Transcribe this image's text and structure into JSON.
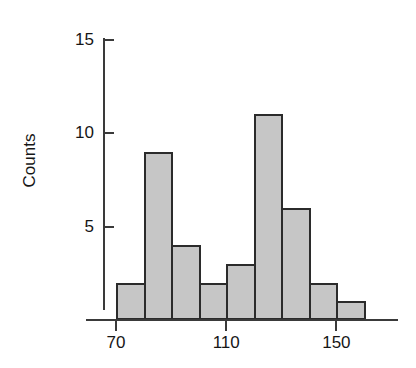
{
  "chart_data": {
    "type": "bar",
    "title": "",
    "subtitle": "",
    "xlabel": "",
    "ylabel": "Counts",
    "bin_width": 10,
    "bin_starts": [
      70,
      80,
      90,
      100,
      110,
      120,
      130,
      140,
      150
    ],
    "categories": [
      "70-80",
      "80-90",
      "90-100",
      "100-110",
      "110-120",
      "120-130",
      "130-140",
      "140-150",
      "150-160"
    ],
    "values": [
      2,
      9,
      4,
      2,
      3,
      11,
      6,
      2,
      1
    ],
    "xlim": [
      70,
      160
    ],
    "ylim": [
      0,
      16
    ],
    "x_ticks": [
      70,
      110,
      150
    ],
    "x_tick_labels": [
      "70",
      "110",
      "150"
    ],
    "y_ticks": [
      5,
      10,
      15
    ],
    "y_tick_labels": [
      "5",
      "10",
      "15"
    ],
    "grid": false,
    "legend": false,
    "legend_position": "none",
    "bar_fill_color": "#c6c6c6",
    "bar_edge_color": "#2b2b2b",
    "axis_color": "#3a3a3a",
    "background_color": "#ffffff"
  },
  "axes": {
    "y_title": "Counts",
    "y_ticks": [
      {
        "label": "15",
        "value": 15
      },
      {
        "label": "10",
        "value": 10
      },
      {
        "label": "5",
        "value": 5
      }
    ],
    "x_ticks": [
      {
        "label": "70",
        "value": 70
      },
      {
        "label": "110",
        "value": 110
      },
      {
        "label": "150",
        "value": 150
      }
    ]
  },
  "bars": [
    {
      "label": "70-80",
      "value": 2
    },
    {
      "label": "80-90",
      "value": 9
    },
    {
      "label": "90-100",
      "value": 4
    },
    {
      "label": "100-110",
      "value": 2
    },
    {
      "label": "110-120",
      "value": 3
    },
    {
      "label": "120-130",
      "value": 11
    },
    {
      "label": "130-140",
      "value": 6
    },
    {
      "label": "140-150",
      "value": 2
    },
    {
      "label": "150-160",
      "value": 1
    }
  ]
}
